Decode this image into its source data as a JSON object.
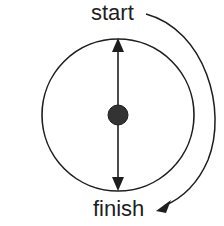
{
  "diagram": {
    "labels": {
      "start": "start",
      "finish": "finish",
      "partial_marker": ")"
    },
    "elements": {
      "circle": {
        "cx": 118,
        "cy": 115,
        "r": 76
      },
      "center_dot": {
        "cx": 118,
        "cy": 115,
        "r": 10
      },
      "vertical_axis": {
        "x": 118,
        "y_top": 38,
        "y_bottom": 191,
        "arrows": [
          "up",
          "down"
        ]
      },
      "rotation_arrow": {
        "direction": "clockwise",
        "from": "start",
        "to": "finish"
      }
    },
    "colors": {
      "stroke": "#1e1e1e",
      "dot_fill": "#333333",
      "background": "#ffffff"
    }
  }
}
